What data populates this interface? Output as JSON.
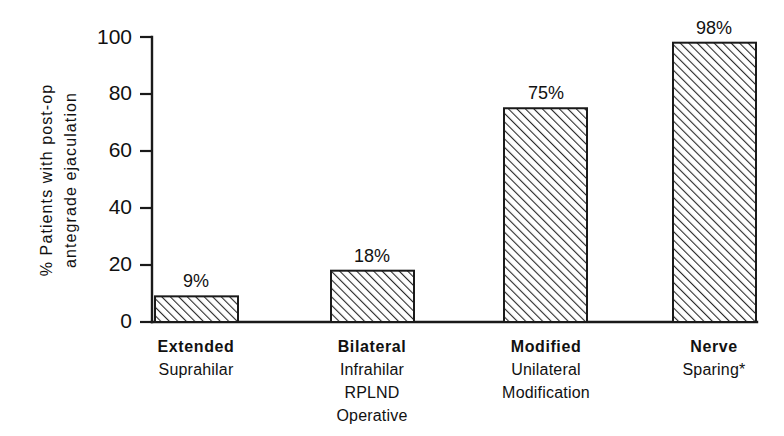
{
  "chart_data": {
    "type": "bar",
    "title": "",
    "xlabel": "",
    "ylabel_line1": "% Patients with post-op",
    "ylabel_line2": "antegrade ejaculation",
    "ylim": [
      0,
      100
    ],
    "yticks": [
      0,
      20,
      40,
      60,
      80,
      100
    ],
    "ytick_labels": [
      "0",
      "20",
      "40",
      "60",
      "80",
      "100"
    ],
    "grid": false,
    "legend": "none",
    "categories": [
      [
        "Extended",
        "Suprahilar"
      ],
      [
        "Bilateral",
        "Infrahilar",
        "RPLND",
        "Operative"
      ],
      [
        "Modified",
        "Unilateral",
        "Modification"
      ],
      [
        "Nerve",
        "Sparing*"
      ]
    ],
    "category_names": [
      "Extended Suprahilar",
      "Bilateral Infrahilar RPLND Operative",
      "Modified Unilateral Modification",
      "Nerve Sparing*"
    ],
    "values": [
      9,
      18,
      75,
      98
    ],
    "value_labels": [
      "9%",
      "18%",
      "75%",
      "98%"
    ],
    "bar_fill": "#ffffff",
    "bar_hatch": "diagonal-45",
    "bar_stroke": "#1a1a1a",
    "background": "#ffffff"
  }
}
